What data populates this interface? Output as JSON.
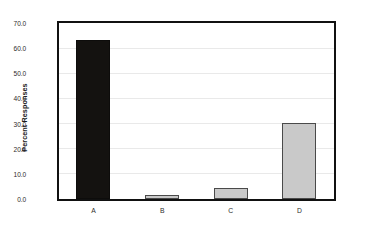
{
  "chart_data": {
    "type": "bar",
    "title": "",
    "xlabel": "",
    "ylabel": "Percent Responses",
    "categories": [
      "A",
      "B",
      "C",
      "D"
    ],
    "values": [
      63.5,
      1.5,
      4.2,
      30.5
    ],
    "bar_colors": [
      "#141210",
      "#c9c9c9",
      "#c9c9c9",
      "#c9c9c9"
    ],
    "ylim": [
      0.0,
      70.0
    ],
    "ytick_step": 10.0,
    "ytick_labels": [
      "0.0",
      "10.0",
      "20.0",
      "30.0",
      "40.0",
      "50.0",
      "60.0",
      "70.0"
    ],
    "ytick_values": [
      0.0,
      10.0,
      20.0,
      30.0,
      40.0,
      50.0,
      60.0,
      70.0
    ],
    "grid": true,
    "grid_color": "#e9e9e9",
    "legend": null,
    "legend_position": "none",
    "plot_border_color": "#111111",
    "background_color": "#ffffff"
  }
}
